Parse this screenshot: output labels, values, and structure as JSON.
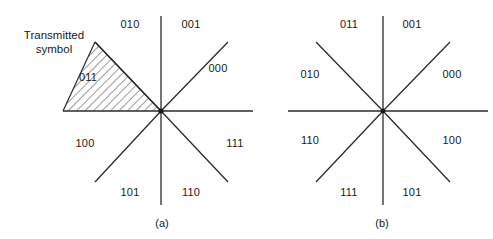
{
  "figure": {
    "background_color": "#ffffff",
    "line_color": "#2b2b2b",
    "text_color": "#1a1a1a",
    "hatch_color": "#3a3a3a"
  },
  "annotation": {
    "line1": "Transmitted",
    "line2": "symbol"
  },
  "panels": [
    {
      "caption": "(a)",
      "center": {
        "x": 161,
        "y": 111
      },
      "sector_labels": [
        {
          "text": "010",
          "x": 130,
          "y": 24
        },
        {
          "text": "001",
          "x": 191,
          "y": 24
        },
        {
          "text": "000",
          "x": 218,
          "y": 68
        },
        {
          "text": "111",
          "x": 235,
          "y": 143
        },
        {
          "text": "110",
          "x": 191,
          "y": 192
        },
        {
          "text": "101",
          "x": 130,
          "y": 192
        },
        {
          "text": "100",
          "x": 85,
          "y": 143
        },
        {
          "text": "011",
          "x": 88,
          "y": 77
        }
      ],
      "highlight_region": "011"
    },
    {
      "caption": "(b)",
      "center": {
        "x": 383,
        "y": 111
      },
      "sector_labels": [
        {
          "text": "011",
          "x": 349,
          "y": 24
        },
        {
          "text": "001",
          "x": 412,
          "y": 24
        },
        {
          "text": "000",
          "x": 452,
          "y": 74
        },
        {
          "text": "100",
          "x": 452,
          "y": 140
        },
        {
          "text": "101",
          "x": 412,
          "y": 192
        },
        {
          "text": "111",
          "x": 349,
          "y": 192
        },
        {
          "text": "110",
          "x": 310,
          "y": 140
        },
        {
          "text": "010",
          "x": 310,
          "y": 74
        }
      ],
      "highlight_region": null
    }
  ]
}
